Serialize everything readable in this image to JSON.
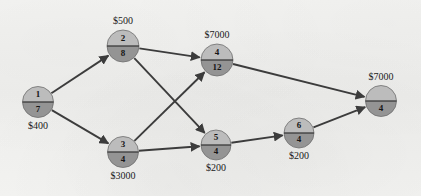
{
  "diagram": {
    "type": "directed-network",
    "canvas": {
      "width": 421,
      "height": 196
    },
    "colors": {
      "background": "#f2f2f0",
      "node_top_half": "#bcbcbc",
      "node_bottom_half": "#949494",
      "node_divider": "#3a3a3a",
      "edge": "#3c3c3c",
      "text": "#161616"
    },
    "nodes": [
      {
        "id": "n1",
        "top_value": "1",
        "bottom_value": "7",
        "cost_label": "$400",
        "cost_position": "below",
        "cx": 38,
        "cy": 102,
        "r": 15.5
      },
      {
        "id": "n2",
        "top_value": "2",
        "bottom_value": "8",
        "cost_label": "$500",
        "cost_position": "above",
        "cx": 123,
        "cy": 46,
        "r": 16
      },
      {
        "id": "n3",
        "top_value": "3",
        "bottom_value": "4",
        "cost_label": "$3000",
        "cost_position": "below",
        "cx": 123,
        "cy": 152,
        "r": 15.5
      },
      {
        "id": "n4",
        "top_value": "4",
        "bottom_value": "12",
        "cost_label": "$7000",
        "cost_position": "above",
        "cx": 217,
        "cy": 60,
        "r": 16
      },
      {
        "id": "n5",
        "top_value": "5",
        "bottom_value": "4",
        "cost_label": "$200",
        "cost_position": "below",
        "cx": 216,
        "cy": 145,
        "r": 15
      },
      {
        "id": "n6",
        "top_value": "6",
        "bottom_value": "4",
        "cost_label": "$200",
        "cost_position": "below",
        "cx": 299,
        "cy": 133,
        "r": 15
      },
      {
        "id": "n7",
        "top_value": "",
        "bottom_value": "4",
        "cost_label": "$7000",
        "cost_position": "above",
        "cx": 381,
        "cy": 101,
        "r": 15.5
      }
    ],
    "edges": [
      {
        "id": "e1",
        "from": "n1",
        "to": "n2",
        "directed": true
      },
      {
        "id": "e2",
        "from": "n1",
        "to": "n3",
        "directed": true
      },
      {
        "id": "e3",
        "from": "n2",
        "to": "n4",
        "directed": true
      },
      {
        "id": "e4",
        "from": "n2",
        "to": "n5",
        "directed": true
      },
      {
        "id": "e5",
        "from": "n3",
        "to": "n4",
        "directed": true
      },
      {
        "id": "e6",
        "from": "n3",
        "to": "n5",
        "directed": true
      },
      {
        "id": "e7",
        "from": "n4",
        "to": "n7",
        "directed": true
      },
      {
        "id": "e8",
        "from": "n5",
        "to": "n6",
        "directed": true
      },
      {
        "id": "e9",
        "from": "n6",
        "to": "n7",
        "directed": true
      }
    ]
  },
  "chart_data": {
    "type": "diagram",
    "node_labels_top": [
      "1",
      "2",
      "3",
      "4",
      "5",
      "6",
      ""
    ],
    "node_labels_bottom": [
      "7",
      "8",
      "4",
      "12",
      "4",
      "4",
      "4"
    ],
    "node_costs": [
      "$400",
      "$500",
      "$3000",
      "$7000",
      "$200",
      "$200",
      "$7000"
    ],
    "edge_list": [
      [
        "1",
        "2"
      ],
      [
        "1",
        "3"
      ],
      [
        "2",
        "4"
      ],
      [
        "2",
        "5"
      ],
      [
        "3",
        "4"
      ],
      [
        "3",
        "5"
      ],
      [
        "4",
        "7"
      ],
      [
        "5",
        "6"
      ],
      [
        "6",
        "7"
      ]
    ]
  }
}
